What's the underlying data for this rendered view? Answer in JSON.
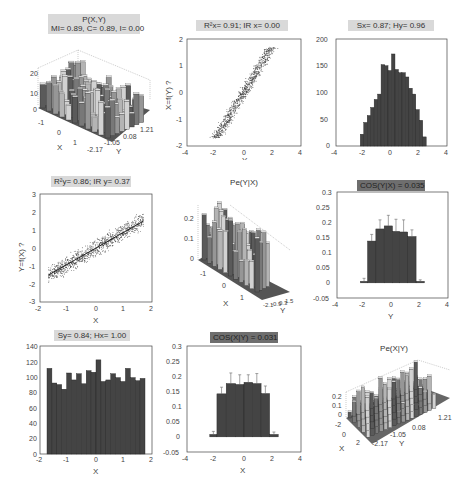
{
  "figure": {
    "panels": [
      {
        "id": "p11",
        "title_line1": "P(X,Y)",
        "title_line2": "MI= 0.89, C= 0.89, I= 0.00",
        "style": "box"
      },
      {
        "id": "p12",
        "title": "R²x= 0.91; IR x= 0.00",
        "style": "box",
        "ylabel": "X=f(Y) ?",
        "xlabel": "Y"
      },
      {
        "id": "p13",
        "title": "Sx= 0.87; Hy= 0.96",
        "style": "box"
      },
      {
        "id": "p21",
        "title": "R²y= 0.86; IR y= 0.37",
        "style": "box",
        "ylabel": "Y=f(X) ?",
        "xlabel": "X"
      },
      {
        "id": "p22",
        "title": "Pe(Y|X)",
        "style": "plain"
      },
      {
        "id": "p23",
        "title": "COS(Y|X) = 0.035",
        "style": "dark",
        "xlabel": "Y"
      },
      {
        "id": "p31",
        "title": "Sy= 0.84; Hx= 1.00",
        "style": "box",
        "xlabel": "X"
      },
      {
        "id": "p32",
        "title": "COS(X|Y) = 0.031",
        "style": "dark",
        "xlabel": "X"
      },
      {
        "id": "p33",
        "title": "Pe(X|Y)",
        "style": "plain"
      }
    ]
  },
  "chart_data": [
    {
      "type": "bar3d",
      "title": "P(X,Y)",
      "subtitle": "MI= 0.89, C= 0.89, I= 0.00",
      "xlabel": "X",
      "ylabel": "Y",
      "x_ticks": [
        "-1",
        "0",
        "1"
      ],
      "y_ticks": [
        "-2.17",
        "-1.05",
        "0.08",
        "1.21"
      ],
      "z_ticks": [
        "0",
        "10",
        "20"
      ]
    },
    {
      "type": "scatter",
      "title": "R²x= 0.91; IR x= 0.00",
      "xlabel": "Y",
      "ylabel": "X=f(Y) ?",
      "xlim": [
        -4,
        4
      ],
      "ylim": [
        -2,
        2
      ],
      "x_ticks": [
        "-4",
        "-2",
        "0",
        "2",
        "4"
      ],
      "y_ticks": [
        "-2",
        "-1",
        "0",
        "1",
        "2"
      ],
      "description": "dense band from (-2,-1.7) to (2,1.7)"
    },
    {
      "type": "bar",
      "title": "Sx= 0.87; Hy= 0.96",
      "xlim": [
        -4,
        4
      ],
      "ylim": [
        0,
        200
      ],
      "x_ticks": [
        "-4",
        "-2",
        "0",
        "2",
        "4"
      ],
      "y_ticks": [
        "0",
        "50",
        "100",
        "150",
        "200"
      ],
      "bin_centers": [
        -2.1,
        -1.85,
        -1.6,
        -1.35,
        -1.1,
        -0.85,
        -0.6,
        -0.35,
        -0.1,
        0.15,
        0.4,
        0.65,
        0.9,
        1.15,
        1.4,
        1.65,
        1.9,
        2.15
      ],
      "values": [
        22,
        44,
        57,
        72,
        87,
        97,
        152,
        150,
        141,
        172,
        143,
        137,
        137,
        129,
        108,
        97,
        68,
        48,
        17
      ]
    },
    {
      "type": "scatter",
      "title": "R²y= 0.86; IR y= 0.37",
      "xlabel": "X",
      "ylabel": "Y=f(X) ?",
      "xlim": [
        -2,
        2
      ],
      "ylim": [
        -3,
        3
      ],
      "x_ticks": [
        "-2",
        "-1",
        "0",
        "1",
        "2"
      ],
      "y_ticks": [
        "-3",
        "-2",
        "-1",
        "0",
        "1",
        "2",
        "3"
      ],
      "description": "band from (-1.7,-1.5) to (1.7,1.5) with spread ~±0.8"
    },
    {
      "type": "bar3d",
      "title": "Pe(Y|X)",
      "xlabel": "X",
      "ylabel": "Y",
      "x_ticks": [
        "-1",
        "0",
        "1"
      ],
      "y_ticks": [
        "-2.1",
        "-0.9",
        "0.3",
        "1.5"
      ],
      "z_ticks": [
        "0",
        "0.1",
        "0.2"
      ]
    },
    {
      "type": "bar",
      "title": "COS(Y|X) = 0.035",
      "xlabel": "Y",
      "xlim": [
        -4,
        4
      ],
      "ylim": [
        -0.05,
        0.3
      ],
      "x_ticks": [
        "-4",
        "-2",
        "0",
        "2",
        "4"
      ],
      "y_ticks": [
        "-0.05",
        "0",
        "0.05",
        "0.1",
        "0.15",
        "0.2",
        "0.25",
        "0.3"
      ],
      "categories": [
        -2.0,
        -1.4,
        -0.85,
        -0.3,
        0.3,
        0.85,
        1.4,
        2.0
      ],
      "values": [
        0.005,
        0.138,
        0.178,
        0.188,
        0.17,
        0.168,
        0.153,
        0.005
      ],
      "error": [
        0.01,
        0.022,
        0.03,
        0.035,
        0.04,
        0.04,
        0.022,
        0.005
      ]
    },
    {
      "type": "bar",
      "title": "Sy= 0.84; Hx= 1.00",
      "xlabel": "X",
      "xlim": [
        -2,
        2
      ],
      "ylim": [
        0,
        140
      ],
      "x_ticks": [
        "-2",
        "-1",
        "0",
        "1",
        "2"
      ],
      "y_ticks": [
        "0",
        "20",
        "40",
        "60",
        "80",
        "100",
        "120",
        "140"
      ],
      "values": [
        111,
        92,
        90,
        84,
        105,
        96,
        104,
        91,
        108,
        106,
        122,
        94,
        96,
        104,
        99,
        94,
        111,
        99,
        95,
        98
      ]
    },
    {
      "type": "bar",
      "title": "COS(X|Y) = 0.031",
      "xlabel": "X",
      "xlim": [
        -4,
        4
      ],
      "ylim": [
        -0.05,
        0.3
      ],
      "x_ticks": [
        "-4",
        "-2",
        "0",
        "2",
        "4"
      ],
      "y_ticks": [
        "-0.05",
        "0",
        "0.05",
        "0.1",
        "0.15",
        "0.2",
        "0.25",
        "0.3"
      ],
      "categories": [
        -2.0,
        -1.5,
        -1.0,
        -0.5,
        0.0,
        0.5,
        1.0,
        1.5,
        2.0
      ],
      "values": [
        0.008,
        0.142,
        0.176,
        0.173,
        0.18,
        0.176,
        0.143,
        0.008
      ],
      "error": [
        0.01,
        0.022,
        0.035,
        0.032,
        0.025,
        0.033,
        0.025,
        0.008
      ]
    },
    {
      "type": "bar3d",
      "title": "Pe(X|Y)",
      "xlabel": "X",
      "ylabel": "Y",
      "x_ticks": [
        "-2",
        "0",
        "2"
      ],
      "y_ticks": [
        "-2.17",
        "-1.05",
        "0.08",
        "1.21"
      ],
      "z_ticks": [
        "0",
        "0.1",
        "0.2"
      ]
    }
  ]
}
